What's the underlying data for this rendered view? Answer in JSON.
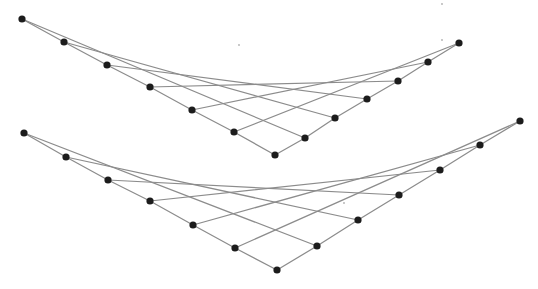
{
  "canvas": {
    "width": 538,
    "height": 289,
    "background": "#ffffff"
  },
  "style": {
    "edge_color": "#8c8c8c",
    "node_color": "#1c1c1c",
    "node_radius": 3.6,
    "speck_color": "#b0b0b0"
  },
  "figures": [
    {
      "id": "upper-envelope",
      "left_arm": [
        [
          22,
          19
        ],
        [
          64,
          42
        ],
        [
          107,
          65
        ],
        [
          150,
          87
        ],
        [
          192,
          110
        ],
        [
          234,
          132
        ]
      ],
      "vertex": [
        275,
        155
      ],
      "right_arm": [
        [
          305,
          138
        ],
        [
          335,
          118
        ],
        [
          367,
          99
        ],
        [
          398,
          81
        ],
        [
          428,
          62
        ],
        [
          459,
          43
        ]
      ]
    },
    {
      "id": "lower-envelope",
      "left_arm": [
        [
          24,
          133
        ],
        [
          66,
          157
        ],
        [
          108,
          180
        ],
        [
          150,
          201
        ],
        [
          193,
          225
        ],
        [
          235,
          248
        ]
      ],
      "vertex": [
        277,
        270
      ],
      "right_arm": [
        [
          317,
          246
        ],
        [
          358,
          220
        ],
        [
          399,
          195
        ],
        [
          440,
          170
        ],
        [
          480,
          145
        ],
        [
          520,
          121
        ]
      ]
    }
  ],
  "specks": [
    [
      442,
      4
    ],
    [
      442,
      40
    ],
    [
      344,
      203
    ],
    [
      239,
      45
    ]
  ]
}
